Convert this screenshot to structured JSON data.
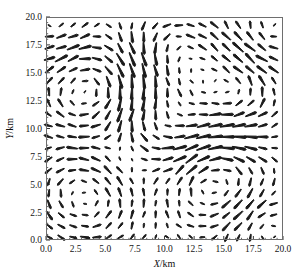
{
  "figure": {
    "width": 304,
    "height": 278,
    "background": "#ffffff"
  },
  "axes": {
    "frame_color": "#6e6e6e",
    "plot_left": 46,
    "plot_top": 17,
    "plot_right": 283,
    "plot_bottom": 240,
    "x_title_plain": "/km",
    "x_title_symbol": "X",
    "y_title_plain": "/km",
    "y_title_symbol": "Y"
  },
  "chart_data": {
    "type": "quiver",
    "title": "",
    "xlabel": "X/km",
    "ylabel": "Y/km",
    "xlim": [
      0.0,
      20.0
    ],
    "ylim": [
      0.0,
      20.0
    ],
    "grid": false,
    "legend": null,
    "xticks": [
      "0.0",
      "2.5",
      "5.0",
      "7.5",
      "10.0",
      "12.5",
      "15.0",
      "17.5",
      "20.0"
    ],
    "yticks": [
      "0.0",
      "2.5",
      "5.0",
      "7.5",
      "10.0",
      "12.5",
      "15.0",
      "17.5",
      "20.0"
    ],
    "xtick_values": [
      0.0,
      2.5,
      5.0,
      7.5,
      10.0,
      12.5,
      15.0,
      17.5,
      20.0
    ],
    "ytick_values": [
      0.0,
      2.5,
      5.0,
      7.5,
      10.0,
      12.5,
      15.0,
      17.5,
      20.0
    ],
    "minor_tick_step": 0.5,
    "grid_nx": 20,
    "grid_ny": 20,
    "grid_x0": 0.25,
    "grid_y0": 0.25,
    "grid_dx": 1.0,
    "grid_dy": 1.0,
    "arrow_color": "#1a1a1a",
    "arrow_scale_px": 11.5,
    "vortices": [
      {
        "x": 3.2,
        "y": 4.0,
        "strength": 1.0,
        "core": 3.1
      },
      {
        "x": 3.8,
        "y": 13.6,
        "strength": -1.05,
        "core": 3.3
      },
      {
        "x": 9.2,
        "y": 9.5,
        "strength": 0.95,
        "core": 3.0
      },
      {
        "x": 10.5,
        "y": 17.0,
        "strength": 0.9,
        "core": 3.0
      },
      {
        "x": 14.3,
        "y": 5.3,
        "strength": -1.0,
        "core": 3.2
      },
      {
        "x": 15.6,
        "y": 13.2,
        "strength": 1.05,
        "core": 3.3
      },
      {
        "x": 7.0,
        "y": 7.2,
        "strength": -0.75,
        "core": 2.4
      },
      {
        "x": 19.0,
        "y": 18.6,
        "strength": -0.7,
        "core": 2.6
      },
      {
        "x": 1.0,
        "y": 19.0,
        "strength": 0.6,
        "core": 2.4
      },
      {
        "x": 18.5,
        "y": 1.0,
        "strength": 0.65,
        "core": 2.5
      }
    ],
    "background_flow": {
      "u": 0.06,
      "v": -0.03
    }
  }
}
